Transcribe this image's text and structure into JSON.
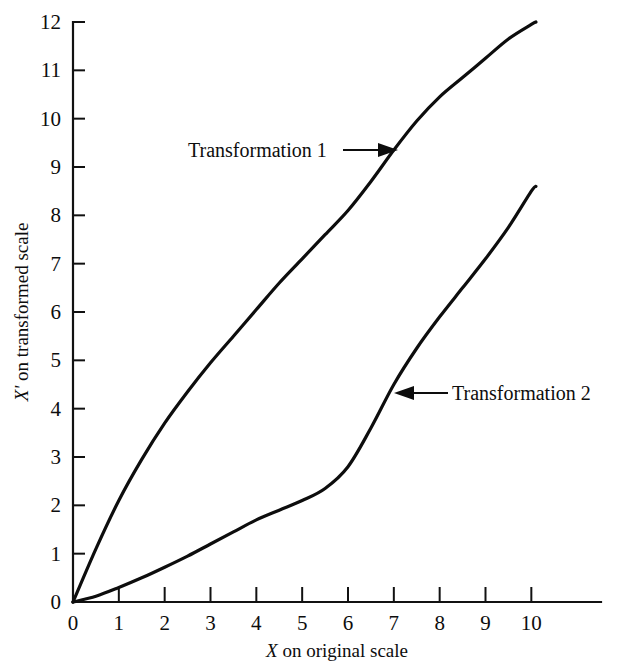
{
  "chart_data": {
    "type": "line",
    "title": "",
    "subtitle": "",
    "xlabel_plain": "X on original scale",
    "xlabel_italic_part": "X",
    "xlabel_rest": " on original scale",
    "ylabel_plain": "X' on transformed scale",
    "ylabel_italic_part": "X'",
    "ylabel_rest": " on transformed scale",
    "xlim": [
      0,
      11.5
    ],
    "ylim": [
      0,
      12
    ],
    "xticks": [
      0,
      1,
      2,
      3,
      4,
      5,
      6,
      7,
      8,
      9,
      10
    ],
    "yticks": [
      0,
      1,
      2,
      3,
      4,
      5,
      6,
      7,
      8,
      9,
      10,
      11,
      12
    ],
    "xtick_labels": [
      "0",
      "1",
      "2",
      "3",
      "4",
      "5",
      "6",
      "7",
      "8",
      "9",
      "10"
    ],
    "ytick_labels": [
      "0",
      "1",
      "2",
      "3",
      "4",
      "5",
      "6",
      "7",
      "8",
      "9",
      "10",
      "11",
      "12"
    ],
    "grid": false,
    "legend_position": "inline-annotations",
    "line_color": "#0d0d0d",
    "background_color": "#ffffff",
    "series": [
      {
        "name": "Transformation 1",
        "shape": "concave-down increasing",
        "x": [
          0,
          0.5,
          1,
          1.5,
          2,
          2.5,
          3,
          3.5,
          4,
          4.5,
          5,
          5.5,
          6,
          6.5,
          7,
          7.5,
          8,
          8.5,
          9,
          9.5,
          10,
          10.1
        ],
        "values": [
          0,
          1.1,
          2.1,
          2.95,
          3.7,
          4.35,
          4.95,
          5.5,
          6.05,
          6.6,
          7.1,
          7.6,
          8.1,
          8.7,
          9.35,
          9.95,
          10.45,
          10.85,
          11.25,
          11.65,
          11.95,
          12.0
        ]
      },
      {
        "name": "Transformation 2",
        "shape": "sigmoid increasing",
        "x": [
          0,
          0.5,
          1,
          1.5,
          2,
          2.5,
          3,
          3.5,
          4,
          4.5,
          5,
          5.5,
          6,
          6.5,
          7,
          7.5,
          8,
          8.5,
          9,
          9.5,
          10,
          10.1
        ],
        "values": [
          0,
          0.12,
          0.3,
          0.5,
          0.72,
          0.95,
          1.2,
          1.45,
          1.7,
          1.9,
          2.1,
          2.35,
          2.8,
          3.6,
          4.5,
          5.25,
          5.9,
          6.5,
          7.1,
          7.75,
          8.5,
          8.6
        ]
      }
    ],
    "annotations": [
      {
        "text": "Transformation 1",
        "points_to_series": "Transformation 1",
        "arrow_direction": "right",
        "target_x": 7.0,
        "target_y": 9.35
      },
      {
        "text": "Transformation 2",
        "points_to_series": "Transformation 2",
        "arrow_direction": "left",
        "target_x": 7.0,
        "target_y": 4.6
      }
    ]
  }
}
